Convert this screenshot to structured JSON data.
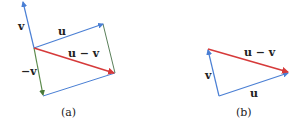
{
  "colors": {
    "u": "#4a7fd4",
    "v": "#4a7fd4",
    "neg_v": "#5a8a4a",
    "diff": "#d63a3a",
    "edge": "#5a7f5a"
  },
  "panel_a": {
    "caption": "(a)",
    "label_v": "v",
    "label_u": "u",
    "label_diff": "u − v",
    "label_neg_v": "−v"
  },
  "panel_b": {
    "caption": "(b)",
    "label_v": "v",
    "label_u": "u",
    "label_diff": "u − v"
  }
}
